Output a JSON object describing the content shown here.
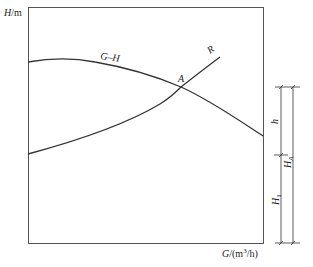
{
  "diagram": {
    "type": "pump-system characteristic curves",
    "y_axis_label": {
      "var": "H",
      "unit": "/m"
    },
    "x_axis_label": {
      "var": "G",
      "unit_prefix": "/(m",
      "unit_sup": "3",
      "unit_suffix": "/h)"
    },
    "curves": [
      {
        "name": "G–H",
        "label": "G–H",
        "description": "pump head curve"
      },
      {
        "name": "R",
        "label": "R",
        "description": "system resistance curve"
      }
    ],
    "intersection_point": {
      "label": "A"
    },
    "dimensions": [
      {
        "label": "h",
        "sub": "",
        "from": "A level",
        "to": "R start level"
      },
      {
        "label": "H",
        "sub": "A",
        "from": "A level",
        "to": "baseline"
      },
      {
        "label": "H",
        "sub": "1",
        "from": "R start level",
        "to": "baseline"
      }
    ],
    "colors": {
      "line": "#333333",
      "frame": "#555555",
      "background": "#ffffff"
    }
  }
}
